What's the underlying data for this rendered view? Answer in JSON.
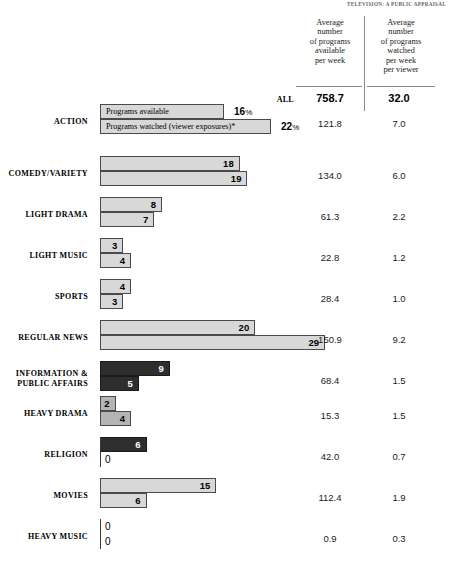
{
  "running_head": "TELEVISION: A PUBLIC APPRAISAL",
  "table": {
    "column_headers": [
      "Average\nnumber\nof programs\navailable\nper week",
      "Average\nnumber\nof programs\nwatched\nper week\nper viewer"
    ],
    "col_available_header": "Average number of programs available per week",
    "col_watched_header": "Average number of programs watched per week per viewer",
    "all_row_label": "ALL",
    "all_available": "758.7",
    "all_watched": "32.0"
  },
  "legend": {
    "available": "Programs available",
    "watched": "Programs watched (viewer exposures)*",
    "available_pct": "16",
    "watched_pct": "22",
    "pct_symbol": "%"
  },
  "chart_data": {
    "type": "bar",
    "xlabel": "Percent of programs",
    "ylabel": "",
    "grid": false,
    "legend_position": "inline-first-row",
    "categories": [
      "ACTION",
      "COMEDY/VARIETY",
      "LIGHT DRAMA",
      "LIGHT MUSIC",
      "SPORTS",
      "REGULAR NEWS",
      "INFORMATION & PUBLIC AFFAIRS",
      "HEAVY DRAMA",
      "RELIGION",
      "MOVIES",
      "HEAVY MUSIC"
    ],
    "series": [
      {
        "name": "Programs available",
        "unit": "%",
        "values": [
          16,
          18,
          8,
          3,
          4,
          20,
          9,
          2,
          6,
          15,
          0
        ]
      },
      {
        "name": "Programs watched (viewer exposures)",
        "unit": "%",
        "values": [
          22,
          19,
          7,
          4,
          3,
          29,
          5,
          4,
          0,
          6,
          0
        ]
      }
    ],
    "table_columns": [
      {
        "name": "Average number of programs available per week",
        "values": [
          121.8,
          134.0,
          61.3,
          22.8,
          28.4,
          150.9,
          68.4,
          15.3,
          42.0,
          112.4,
          0.9
        ],
        "total": 758.7
      },
      {
        "name": "Average number of programs watched per week per viewer",
        "values": [
          7.0,
          6.0,
          2.2,
          1.2,
          1.0,
          9.2,
          1.5,
          1.5,
          0.7,
          1.9,
          0.3
        ],
        "total": 32.0
      }
    ]
  },
  "rows": [
    {
      "label": "ACTION",
      "label_lines": [
        "ACTION"
      ],
      "top": 104,
      "label_top": 117,
      "num_top": 118,
      "available": {
        "value": 16,
        "display": "",
        "legend": "Programs available",
        "shade": "light",
        "pct": "16",
        "pct_x": 234
      },
      "watched": {
        "value": 22,
        "display": "",
        "legend": "Programs watched (viewer exposures)*",
        "shade": "light",
        "pct": "22",
        "pct_x": 281
      },
      "avail_num": "121.8",
      "watch_num": "7.0"
    },
    {
      "label": "COMEDY/VARIETY",
      "label_lines": [
        "COMEDY/VARIETY"
      ],
      "top": 156,
      "label_top": 169,
      "num_top": 170,
      "available": {
        "value": 18,
        "display": "18",
        "shade": "light"
      },
      "watched": {
        "value": 19,
        "display": "19",
        "shade": "light"
      },
      "avail_num": "134.0",
      "watch_num": "6.0"
    },
    {
      "label": "LIGHT DRAMA",
      "label_lines": [
        "LIGHT DRAMA"
      ],
      "top": 197,
      "label_top": 210,
      "num_top": 211,
      "available": {
        "value": 8,
        "display": "8",
        "shade": "light"
      },
      "watched": {
        "value": 7,
        "display": "7",
        "shade": "light"
      },
      "avail_num": "61.3",
      "watch_num": "2.2"
    },
    {
      "label": "LIGHT MUSIC",
      "label_lines": [
        "LIGHT MUSIC"
      ],
      "top": 238,
      "label_top": 251,
      "num_top": 252,
      "available": {
        "value": 3,
        "display": "3",
        "shade": "light"
      },
      "watched": {
        "value": 4,
        "display": "4",
        "shade": "light"
      },
      "avail_num": "22.8",
      "watch_num": "1.2"
    },
    {
      "label": "SPORTS",
      "label_lines": [
        "SPORTS"
      ],
      "top": 279,
      "label_top": 292,
      "num_top": 293,
      "available": {
        "value": 4,
        "display": "4",
        "shade": "light"
      },
      "watched": {
        "value": 3,
        "display": "3",
        "shade": "light"
      },
      "avail_num": "28.4",
      "watch_num": "1.0"
    },
    {
      "label": "REGULAR NEWS",
      "label_lines": [
        "REGULAR NEWS"
      ],
      "top": 320,
      "label_top": 333,
      "num_top": 334,
      "available": {
        "value": 20,
        "display": "20",
        "shade": "light"
      },
      "watched": {
        "value": 29,
        "display": "29",
        "shade": "light"
      },
      "avail_num": "150.9",
      "watch_num": "9.2"
    },
    {
      "label": "INFORMATION & PUBLIC AFFAIRS",
      "label_lines": [
        "INFORMATION &",
        "PUBLIC AFFAIRS"
      ],
      "top": 361,
      "label_top": 369,
      "num_top": 375,
      "available": {
        "value": 9,
        "display": "9",
        "shade": "dark"
      },
      "watched": {
        "value": 5,
        "display": "5",
        "shade": "dark"
      },
      "avail_num": "68.4",
      "watch_num": "1.5"
    },
    {
      "label": "HEAVY DRAMA",
      "label_lines": [
        "HEAVY DRAMA"
      ],
      "top": 396,
      "label_top": 409,
      "num_top": 410,
      "available": {
        "value": 2,
        "display": "2",
        "shade": "mid"
      },
      "watched": {
        "value": 4,
        "display": "4",
        "shade": "mid"
      },
      "avail_num": "15.3",
      "watch_num": "1.5"
    },
    {
      "label": "RELIGION",
      "label_lines": [
        "RELIGION"
      ],
      "top": 437,
      "label_top": 450,
      "num_top": 451,
      "available": {
        "value": 6,
        "display": "6",
        "shade": "dark"
      },
      "watched": {
        "value": 0,
        "display": "0",
        "shade": "zero"
      },
      "avail_num": "42.0",
      "watch_num": "0.7"
    },
    {
      "label": "MOVIES",
      "label_lines": [
        "MOVIES"
      ],
      "top": 478,
      "label_top": 491,
      "num_top": 492,
      "available": {
        "value": 15,
        "display": "15",
        "shade": "light"
      },
      "watched": {
        "value": 6,
        "display": "6",
        "shade": "light"
      },
      "avail_num": "112.4",
      "watch_num": "1.9"
    },
    {
      "label": "HEAVY MUSIC",
      "label_lines": [
        "HEAVY MUSIC"
      ],
      "top": 519,
      "label_top": 532,
      "num_top": 533,
      "available": {
        "value": 0,
        "display": "0",
        "shade": "zero"
      },
      "watched": {
        "value": 0,
        "display": "0",
        "shade": "zero"
      },
      "avail_num": "0.9",
      "watch_num": "0.3"
    }
  ],
  "scale_px_per_unit": 7.76,
  "colors": {
    "bar_light": "#d3d3d3",
    "bar_mid": "#b4b4b4",
    "bar_dark": "#2e2e2e",
    "bar_border": "#4a4a4a",
    "rule": "#8a8a8a",
    "text": "#000000"
  }
}
